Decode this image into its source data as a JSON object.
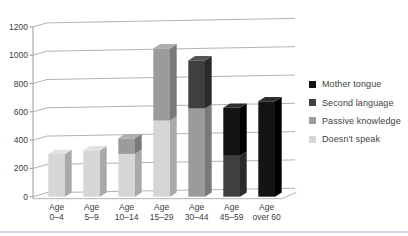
{
  "page": {
    "background": "#ffffff",
    "bottom_rule_color": "#cfdae6"
  },
  "colors": {
    "gridline": "#b3b3b3",
    "axis": "#9a9a9a",
    "label_text": "#3d3d3d",
    "floor_edge": "#b3b3b3"
  },
  "chart_data": {
    "type": "bar",
    "variant": "3d-stacked-column",
    "title": "",
    "xlabel": "",
    "ylabel": "",
    "gridlines": true,
    "legend_position": "right",
    "categories": [
      [
        "Age",
        "0–4"
      ],
      [
        "Age",
        "5–9"
      ],
      [
        "Age",
        "10–14"
      ],
      [
        "Age",
        "15–29"
      ],
      [
        "Age",
        "30–44"
      ],
      [
        "Age",
        "45–59"
      ],
      [
        "Age",
        "over 60"
      ]
    ],
    "series": [
      {
        "name": "Doesn't speak",
        "values": [
          300,
          320,
          290,
          520,
          0,
          0,
          0
        ],
        "color": "#d6d6d6",
        "side_color": "#a9a9a9",
        "top_color": "#e2e2e2"
      },
      {
        "name": "Passive knowledge",
        "values": [
          0,
          0,
          110,
          510,
          600,
          0,
          0
        ],
        "color": "#9b9b9b",
        "side_color": "#7a7a7a",
        "top_color": "#aeaeae"
      },
      {
        "name": "Second language",
        "values": [
          0,
          0,
          0,
          0,
          340,
          260,
          0
        ],
        "color": "#3f3f3f",
        "side_color": "#2a2a2a",
        "top_color": "#555555"
      },
      {
        "name": "Mother tongue",
        "values": [
          0,
          0,
          0,
          0,
          0,
          340,
          640
        ],
        "color": "#141414",
        "side_color": "#000000",
        "top_color": "#2e2e2e"
      }
    ],
    "stack_totals": [
      300,
      320,
      400,
      1030,
      940,
      600,
      640
    ],
    "y_axis": {
      "min": 0,
      "max": 1200,
      "step": 200,
      "ticks": [
        0,
        200,
        400,
        600,
        800,
        1000,
        1200
      ]
    }
  }
}
